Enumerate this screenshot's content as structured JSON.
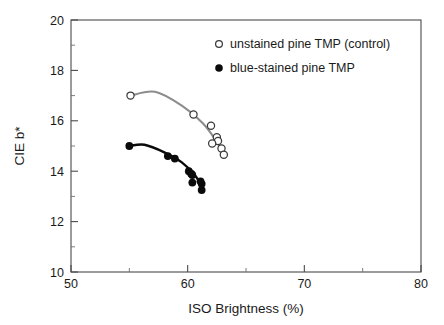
{
  "figure": {
    "background_color": "#ffffff",
    "frame_color": "#4a4a4a"
  },
  "chart_data": {
    "type": "scatter",
    "title": "",
    "subtitle": "",
    "xlabel": "ISO Brightness (%)",
    "ylabel": "CIE b*",
    "xlim": [
      50,
      80
    ],
    "ylim": [
      10,
      20
    ],
    "xticks": [
      50,
      60,
      70,
      80
    ],
    "xtick_labels": [
      "50",
      "60",
      "70",
      "80"
    ],
    "xticks_minor": [
      55,
      65,
      75
    ],
    "yticks": [
      10,
      12,
      14,
      16,
      18,
      20
    ],
    "ytick_labels": [
      "10",
      "12",
      "14",
      "16",
      "18",
      "20"
    ],
    "yticks_minor": [
      11,
      13,
      15,
      17,
      19
    ],
    "grid": false,
    "legend_position": "top-right",
    "series": [
      {
        "name": "unstained pine TMP (control)",
        "marker": "open-circle",
        "marker_color": "#ffffff",
        "marker_edge_color": "#3a3a3a",
        "curve_color": "#8c8c8c",
        "points": [
          {
            "x": 55.1,
            "y": 17.0
          },
          {
            "x": 60.5,
            "y": 16.25
          },
          {
            "x": 62.0,
            "y": 15.8
          },
          {
            "x": 62.5,
            "y": 15.35
          },
          {
            "x": 62.6,
            "y": 15.2
          },
          {
            "x": 62.1,
            "y": 15.1
          },
          {
            "x": 62.9,
            "y": 14.9
          },
          {
            "x": 63.1,
            "y": 14.65
          }
        ],
        "fit_curve": [
          {
            "x": 55.1,
            "y": 17.0
          },
          {
            "x": 57.2,
            "y": 17.15
          },
          {
            "x": 59.5,
            "y": 16.6
          },
          {
            "x": 61.3,
            "y": 15.9
          },
          {
            "x": 62.6,
            "y": 15.1
          },
          {
            "x": 63.2,
            "y": 14.65
          }
        ]
      },
      {
        "name": "blue-stained pine TMP",
        "marker": "filled-circle",
        "marker_color": "#0a0a0a",
        "marker_edge_color": "#0a0a0a",
        "curve_color": "#0a0a0a",
        "points": [
          {
            "x": 55.0,
            "y": 15.0
          },
          {
            "x": 58.3,
            "y": 14.6
          },
          {
            "x": 58.9,
            "y": 14.5
          },
          {
            "x": 60.1,
            "y": 14.0
          },
          {
            "x": 60.3,
            "y": 13.9
          },
          {
            "x": 60.4,
            "y": 13.85
          },
          {
            "x": 60.4,
            "y": 13.55
          },
          {
            "x": 61.1,
            "y": 13.6
          },
          {
            "x": 61.2,
            "y": 13.5
          },
          {
            "x": 61.2,
            "y": 13.25
          }
        ],
        "fit_curve": [
          {
            "x": 55.0,
            "y": 15.0
          },
          {
            "x": 56.3,
            "y": 15.05
          },
          {
            "x": 58.0,
            "y": 14.75
          },
          {
            "x": 59.5,
            "y": 14.35
          },
          {
            "x": 60.6,
            "y": 13.85
          },
          {
            "x": 61.3,
            "y": 13.35
          }
        ]
      }
    ]
  },
  "legend": {
    "entries": [
      {
        "label": "unstained pine TMP (control)",
        "marker": "open-circle"
      },
      {
        "label": "blue-stained pine TMP",
        "marker": "filled-circle"
      }
    ]
  }
}
